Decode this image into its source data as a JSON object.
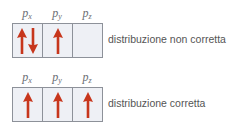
{
  "diagrams": [
    {
      "caption": "distribuzione non corretta",
      "orbitals": [
        {
          "label": "p",
          "sub": "x",
          "electrons": [
            "up",
            "down"
          ]
        },
        {
          "label": "p",
          "sub": "y",
          "electrons": [
            "up"
          ]
        },
        {
          "label": "p",
          "sub": "z",
          "electrons": []
        }
      ]
    },
    {
      "caption": "distribuzione corretta",
      "orbitals": [
        {
          "label": "p",
          "sub": "x",
          "electrons": [
            "up"
          ]
        },
        {
          "label": "p",
          "sub": "y",
          "electrons": [
            "up"
          ]
        },
        {
          "label": "p",
          "sub": "z",
          "electrons": [
            "up"
          ]
        }
      ]
    }
  ],
  "colors": {
    "arrow": "#c7361c",
    "border": "#8d9199",
    "cell": "#eef0f5"
  }
}
